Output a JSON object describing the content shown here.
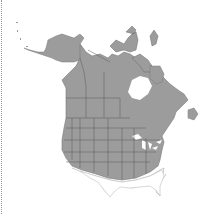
{
  "map": {
    "type": "range-map",
    "region": "North America",
    "legend": {
      "range_fill": "#9c9c9c",
      "boundary_stroke": "#5a5a5a",
      "outside_range_fill": "#ffffff",
      "outside_range_stroke": "#b5b5b5",
      "water": "#ffffff"
    },
    "shaded_range": "Alaska, Canada (except far Arctic islands partly), contiguous United States except the southern tier (Texas, Gulf states, Florida)",
    "unshaded_areas": [
      "Texas",
      "Louisiana",
      "Mississippi",
      "Alabama",
      "Georgia (south)",
      "Florida",
      "northern Mexico"
    ]
  }
}
